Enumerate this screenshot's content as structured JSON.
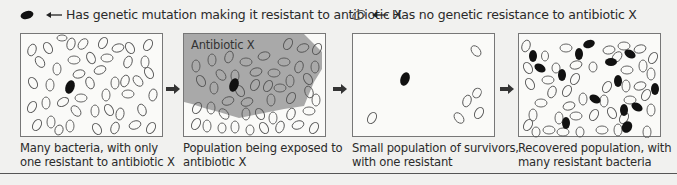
{
  "legend": {
    "resistant": {
      "icon": "filled-ellipse-icon",
      "label": "Has genetic mutation making it resistant to antibiotic X"
    },
    "non_resistant": {
      "icon": "hollow-ellipse-icon",
      "label": "Has no genetic resistance to antibiotic X"
    }
  },
  "panels": [
    {
      "caption_line1": "Many bacteria, with only",
      "caption_line2": "one resistant to antibiotic X",
      "resistant_count": 1
    },
    {
      "label": "Antibiotic X",
      "caption_line1": "Population being exposed to",
      "caption_line2": "antibiotic X",
      "resistant_count": 1
    },
    {
      "caption_line1": "Small population of survivors,",
      "caption_line2": "with one resistant",
      "resistant_count": 1,
      "non_resistant_count": 6
    },
    {
      "caption_line1": "Recovered population, with",
      "caption_line2": "many resistant bacteria",
      "resistant_count": 16
    }
  ],
  "colors": {
    "antibiotic_area": "#a9a9a9",
    "bacterium_fill": "#111111",
    "bacterium_outline": "#555555",
    "border": "#777777"
  }
}
